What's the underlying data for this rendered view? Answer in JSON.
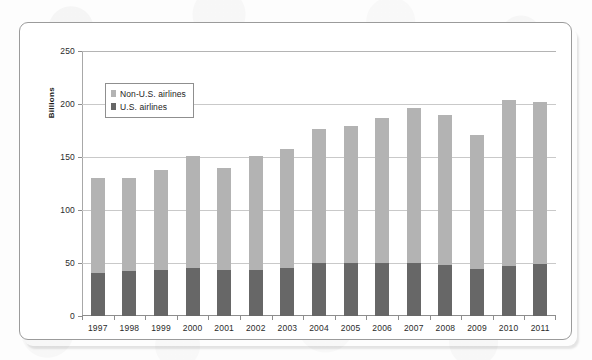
{
  "chart_data": {
    "type": "bar",
    "stacked": true,
    "title": "",
    "subtitle": "",
    "xlabel": "",
    "ylabel": "Billions",
    "ylim": [
      0,
      250
    ],
    "ytick_labels": [
      "0",
      "50",
      "100",
      "150",
      "200",
      "250"
    ],
    "ytick_values": [
      0,
      50,
      100,
      150,
      200,
      250
    ],
    "grid": true,
    "legend_position": "upper-left-inside",
    "categories": [
      "1997",
      "1998",
      "1999",
      "2000",
      "2001",
      "2002",
      "2003",
      "2004",
      "2005",
      "2006",
      "2007",
      "2008",
      "2009",
      "2010",
      "2011"
    ],
    "series": [
      {
        "name": "U.S. airlines",
        "color": "#676767",
        "values": [
          41,
          42,
          43,
          45,
          43,
          43,
          45,
          50,
          50,
          50,
          50,
          48,
          44,
          47,
          49
        ]
      },
      {
        "name": "Non-U.S. airlines",
        "color": "#b3b3b3",
        "values": [
          89,
          88,
          95,
          106,
          97,
          108,
          113,
          126,
          129,
          137,
          146,
          142,
          127,
          157,
          153
        ]
      }
    ],
    "totals": [
      130,
      130,
      138,
      151,
      140,
      151,
      158,
      176,
      179,
      187,
      196,
      190,
      171,
      204,
      202
    ]
  },
  "legend": {
    "items": [
      {
        "label": "Non-U.S. airlines",
        "color": "#b3b3b3"
      },
      {
        "label": "U.S. airlines",
        "color": "#676767"
      }
    ]
  },
  "axis": {
    "y_title": "Billions"
  }
}
